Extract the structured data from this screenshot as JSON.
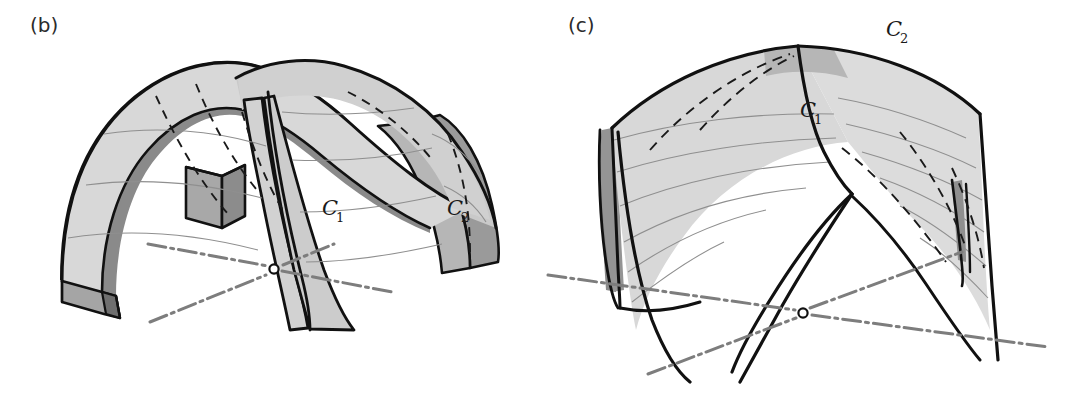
{
  "figure": {
    "background_color": "#ffffff",
    "width": 1068,
    "height": 405
  },
  "palette": {
    "outline": "#111111",
    "hidden_line": "#1a1a1a",
    "axis_line": "#7d7d7d",
    "surface_light": "#dcdcdc",
    "surface_mid": "#c4c4c4",
    "surface_dark": "#9a9a9a",
    "surface_darker": "#8a8a8a",
    "ruling_line": "#8f8f8f",
    "pier_front": "#b4b4b4",
    "pier_side": "#8e8e8e",
    "origin_fill": "#ffffff",
    "label_color": "#2b2b2b"
  },
  "panels": [
    {
      "id": "panel-b",
      "label": "(b)",
      "label_x": 30,
      "label_y": 32,
      "description": "Two barrel vault surfaces crossing at right angles, drawn with surface thickness and a central pier block",
      "curve_labels": [
        {
          "name": "C1",
          "base": "C",
          "subscript": "1",
          "x": 322,
          "y": 215
        },
        {
          "name": "C2",
          "base": "C",
          "subscript": "2",
          "x": 447,
          "y": 215
        }
      ],
      "origin_marker": {
        "x": 274,
        "y": 269,
        "radius": 4.5,
        "label": "O"
      },
      "axes": [
        {
          "name": "axis-left-front",
          "x1": 148,
          "y1": 244,
          "x2": 292,
          "y2": 271
        },
        {
          "name": "axis-right-back",
          "x1": 286,
          "y1": 272,
          "x2": 392,
          "y2": 292
        },
        {
          "name": "axis-front-diagonal",
          "x1": 150,
          "y1": 322,
          "x2": 268,
          "y2": 274
        },
        {
          "name": "axis-back-diagonal",
          "x1": 282,
          "y1": 266,
          "x2": 330,
          "y2": 262
        }
      ]
    },
    {
      "id": "panel-c",
      "label": "(c)",
      "label_x": 568,
      "label_y": 32,
      "description": "Groin vault formed by the intersection of the two surfaces, seen from a higher viewpoint with pointed feet",
      "curve_labels": [
        {
          "name": "C1",
          "base": "C",
          "subscript": "1",
          "x": 800,
          "y": 117
        },
        {
          "name": "C2",
          "base": "C",
          "subscript": "2",
          "x": 886,
          "y": 32
        }
      ],
      "origin_marker": {
        "x": 803,
        "y": 313,
        "radius": 4.5,
        "label": "O"
      },
      "axes": [
        {
          "name": "axis-left-to-origin",
          "x1": 548,
          "y1": 275,
          "x2": 795,
          "y2": 313
        },
        {
          "name": "axis-origin-to-right",
          "x1": 811,
          "y1": 314,
          "x2": 1048,
          "y2": 345
        },
        {
          "name": "axis-front-diagonal",
          "x1": 650,
          "y1": 372,
          "x2": 796,
          "y2": 318
        },
        {
          "name": "axis-back-diagonal",
          "x1": 810,
          "y1": 309,
          "x2": 960,
          "y2": 253
        }
      ]
    }
  ],
  "legend_notes": {
    "solid_line": "visible surface boundary",
    "dashed_line": "hidden edge behind surface",
    "dash_dot_line": "ground axis",
    "thin_line": "surface ruling line",
    "circle_marker": "origin point where the two axes meet"
  }
}
